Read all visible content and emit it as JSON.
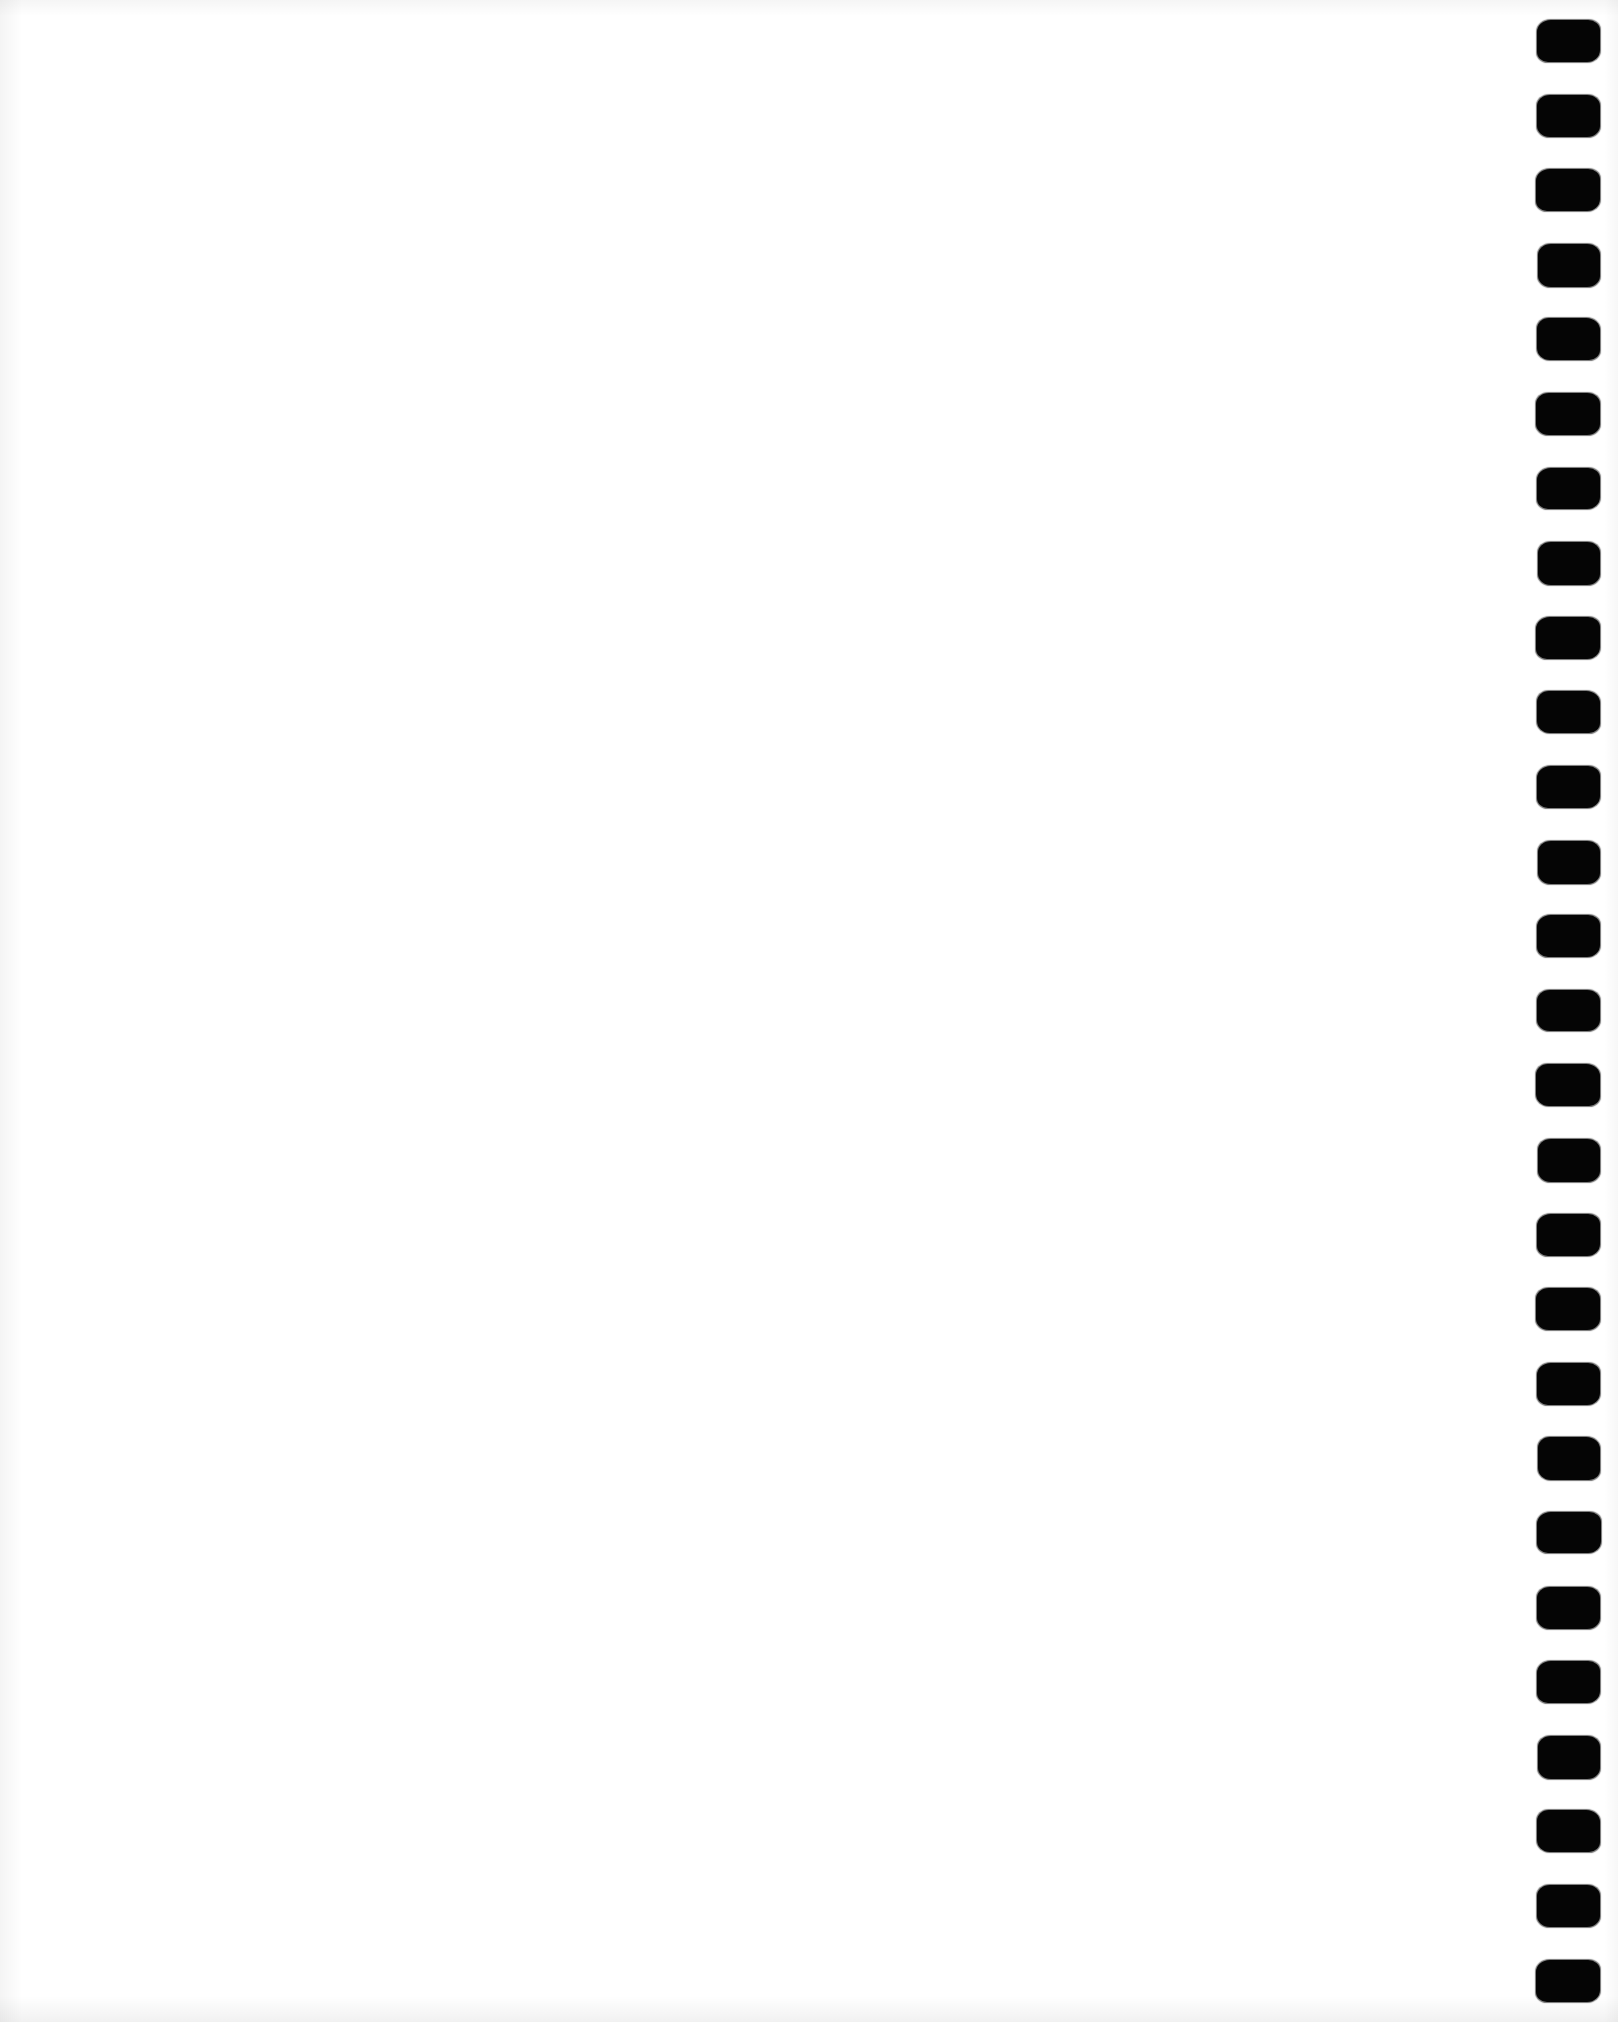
{
  "document": {
    "type": "scanned-page",
    "title": "Scanned blank notebook page",
    "orientation": "portrait",
    "page_width_px": 1618,
    "page_height_px": 2022,
    "content_text": "",
    "is_blank": true,
    "visible_text_blocks": [],
    "background_color": "#ffffff",
    "paper_tone_color": "#fdfdfd",
    "edge_shadow_color": "#f0f0f0"
  },
  "binding": {
    "label": "spiral binding holes",
    "edge": "right",
    "hole_count": 27,
    "hole_shape": "rounded-rectangle",
    "hole_color": "#050505",
    "hole_width_px": 63,
    "hole_height_px": 42,
    "hole_spacing_px": 74.6,
    "first_hole_top_px": 20,
    "column_left_px": 1537,
    "column_right_px": 1600
  },
  "writing_area": {
    "label": "blank writing area",
    "left_px": 40,
    "top_px": 30,
    "width_px": 1460,
    "height_px": 1960,
    "ruling": "none",
    "margin_rule": "none"
  }
}
